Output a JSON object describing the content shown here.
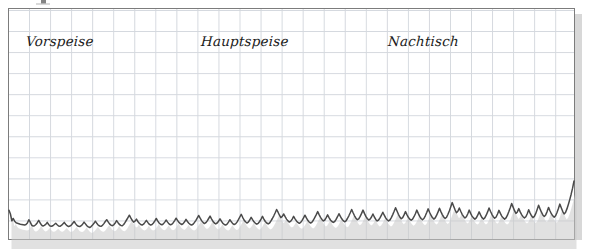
{
  "figure": {
    "type": "chart-on-graph-paper",
    "background_color": "#ffffff",
    "frame_color": "#7c7c7c",
    "grid_color": "#d2d6dc",
    "line_color": "#4a4a4a",
    "shadow_color": "#c8c8c8"
  },
  "labels": {
    "course_1": "Vorspeise",
    "course_2": "Hauptspeise",
    "course_3": "Nachtisch"
  },
  "chart_data": {
    "type": "line",
    "title": "",
    "subtitle": "",
    "xlabel": "",
    "ylabel": "",
    "grid": true,
    "legend": null,
    "annotations": [
      {
        "text": "Vorspeise",
        "x": 0.06,
        "y": 0.85
      },
      {
        "text": "Hauptspeise",
        "x": 0.37,
        "y": 0.85
      },
      {
        "text": "Nachtisch",
        "x": 0.68,
        "y": 0.85
      }
    ],
    "xlim": [
      0,
      1
    ],
    "ylim": [
      0,
      1
    ],
    "series": [
      {
        "name": "signal",
        "color": "#4a4a4a",
        "values": [
          0.145,
          0.12,
          0.075,
          0.09,
          0.072,
          0.062,
          0.058,
          0.055,
          0.052,
          0.05,
          0.048,
          0.046,
          0.05,
          0.06,
          0.082,
          0.066,
          0.046,
          0.04,
          0.042,
          0.05,
          0.062,
          0.078,
          0.06,
          0.046,
          0.04,
          0.044,
          0.052,
          0.064,
          0.05,
          0.04,
          0.038,
          0.042,
          0.05,
          0.058,
          0.048,
          0.04,
          0.038,
          0.044,
          0.054,
          0.064,
          0.052,
          0.042,
          0.036,
          0.04,
          0.046,
          0.058,
          0.07,
          0.056,
          0.044,
          0.038,
          0.036,
          0.042,
          0.052,
          0.066,
          0.054,
          0.042,
          0.034,
          0.03,
          0.036,
          0.046,
          0.058,
          0.072,
          0.058,
          0.046,
          0.04,
          0.038,
          0.044,
          0.056,
          0.07,
          0.082,
          0.068,
          0.054,
          0.046,
          0.042,
          0.048,
          0.06,
          0.076,
          0.062,
          0.05,
          0.044,
          0.042,
          0.05,
          0.064,
          0.08,
          0.096,
          0.112,
          0.094,
          0.078,
          0.066,
          0.072,
          0.086,
          0.07,
          0.058,
          0.05,
          0.046,
          0.052,
          0.064,
          0.078,
          0.064,
          0.052,
          0.046,
          0.05,
          0.06,
          0.074,
          0.09,
          0.074,
          0.06,
          0.052,
          0.048,
          0.054,
          0.066,
          0.08,
          0.066,
          0.054,
          0.048,
          0.052,
          0.062,
          0.076,
          0.092,
          0.078,
          0.064,
          0.056,
          0.05,
          0.056,
          0.068,
          0.084,
          0.07,
          0.058,
          0.05,
          0.046,
          0.052,
          0.064,
          0.078,
          0.094,
          0.11,
          0.092,
          0.076,
          0.064,
          0.056,
          0.062,
          0.074,
          0.09,
          0.106,
          0.088,
          0.072,
          0.06,
          0.054,
          0.06,
          0.072,
          0.088,
          0.072,
          0.058,
          0.05,
          0.046,
          0.052,
          0.066,
          0.082,
          0.068,
          0.056,
          0.05,
          0.054,
          0.066,
          0.082,
          0.1,
          0.118,
          0.098,
          0.08,
          0.068,
          0.06,
          0.066,
          0.08,
          0.098,
          0.082,
          0.068,
          0.058,
          0.052,
          0.058,
          0.07,
          0.086,
          0.104,
          0.086,
          0.07,
          0.06,
          0.054,
          0.06,
          0.074,
          0.09,
          0.108,
          0.128,
          0.15,
          0.132,
          0.112,
          0.096,
          0.104,
          0.12,
          0.102,
          0.086,
          0.074,
          0.066,
          0.072,
          0.086,
          0.104,
          0.088,
          0.074,
          0.064,
          0.058,
          0.064,
          0.078,
          0.094,
          0.112,
          0.094,
          0.078,
          0.066,
          0.06,
          0.066,
          0.08,
          0.098,
          0.116,
          0.136,
          0.116,
          0.098,
          0.084,
          0.074,
          0.08,
          0.096,
          0.114,
          0.096,
          0.08,
          0.07,
          0.064,
          0.07,
          0.084,
          0.102,
          0.122,
          0.104,
          0.088,
          0.076,
          0.068,
          0.074,
          0.09,
          0.108,
          0.128,
          0.15,
          0.128,
          0.108,
          0.092,
          0.082,
          0.088,
          0.104,
          0.124,
          0.146,
          0.124,
          0.104,
          0.09,
          0.08,
          0.086,
          0.1,
          0.12,
          0.1,
          0.084,
          0.074,
          0.08,
          0.094,
          0.112,
          0.132,
          0.112,
          0.094,
          0.082,
          0.074,
          0.08,
          0.096,
          0.116,
          0.138,
          0.162,
          0.14,
          0.118,
          0.1,
          0.088,
          0.096,
          0.114,
          0.136,
          0.116,
          0.098,
          0.086,
          0.078,
          0.086,
          0.102,
          0.122,
          0.146,
          0.124,
          0.104,
          0.09,
          0.082,
          0.09,
          0.108,
          0.13,
          0.154,
          0.132,
          0.112,
          0.096,
          0.086,
          0.094,
          0.112,
          0.134,
          0.158,
          0.136,
          0.116,
          0.1,
          0.09,
          0.098,
          0.118,
          0.142,
          0.168,
          0.196,
          0.172,
          0.148,
          0.128,
          0.138,
          0.16,
          0.138,
          0.118,
          0.104,
          0.094,
          0.102,
          0.122,
          0.146,
          0.124,
          0.106,
          0.094,
          0.086,
          0.094,
          0.112,
          0.134,
          0.114,
          0.096,
          0.086,
          0.094,
          0.112,
          0.134,
          0.16,
          0.138,
          0.118,
          0.102,
          0.092,
          0.1,
          0.12,
          0.144,
          0.124,
          0.106,
          0.094,
          0.086,
          0.094,
          0.112,
          0.136,
          0.162,
          0.19,
          0.166,
          0.142,
          0.124,
          0.134,
          0.156,
          0.134,
          0.116,
          0.102,
          0.094,
          0.102,
          0.122,
          0.148,
          0.126,
          0.108,
          0.096,
          0.104,
          0.124,
          0.15,
          0.178,
          0.154,
          0.132,
          0.114,
          0.104,
          0.114,
          0.136,
          0.164,
          0.142,
          0.122,
          0.108,
          0.098,
          0.108,
          0.13,
          0.156,
          0.186,
          0.162,
          0.138,
          0.12,
          0.13,
          0.154,
          0.184,
          0.216,
          0.252,
          0.292,
          0.34
        ]
      }
    ]
  }
}
